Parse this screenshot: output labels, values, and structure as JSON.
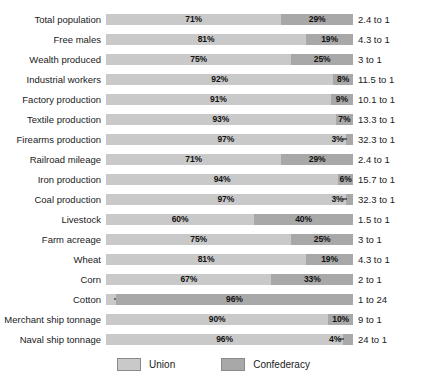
{
  "chart_data": {
    "type": "bar",
    "subtype": "stacked-horizontal-100pct",
    "title": "",
    "xlabel": "",
    "ylabel": "",
    "xlim": [
      0,
      100
    ],
    "grid": false,
    "legend_position": "bottom-center",
    "legend": [
      "Union",
      "Confederacy"
    ],
    "colors": {
      "union": "#c9c9c9",
      "confederacy": "#a8a8a8",
      "background": "#ffffff",
      "text": "#1a1a1a"
    },
    "categories": [
      "Total population",
      "Free males",
      "Wealth produced",
      "Industrial workers",
      "Factory production",
      "Textile production",
      "Firearms production",
      "Railroad mileage",
      "Iron production",
      "Coal production",
      "Livestock",
      "Farm acreage",
      "Wheat",
      "Corn",
      "Cotton",
      "Merchant ship tonnage",
      "Naval ship tonnage"
    ],
    "series": [
      {
        "name": "Union",
        "values": [
          71,
          81,
          75,
          92,
          91,
          93,
          97,
          71,
          94,
          97,
          60,
          75,
          81,
          67,
          4,
          90,
          96
        ]
      },
      {
        "name": "Confederacy",
        "values": [
          29,
          19,
          25,
          8,
          9,
          7,
          3,
          29,
          6,
          3,
          40,
          25,
          19,
          33,
          96,
          10,
          4
        ]
      }
    ],
    "ratios": [
      "2.4 to 1",
      "4.3 to 1",
      "3 to 1",
      "11.5 to 1",
      "10.1 to 1",
      "13.3 to 1",
      "32.3 to 1",
      "2.4 to 1",
      "15.7 to 1",
      "32.3 to 1",
      "1.5 to 1",
      "3 to 1",
      "4.3 to 1",
      "2 to 1",
      "1 to 24",
      "9 to 1",
      "24 to 1"
    ],
    "rows": [
      {
        "label": "Total population",
        "union": 71,
        "confederacy": 29,
        "union_label": "71%",
        "confederacy_label": "29%",
        "ratio": "2.4 to 1",
        "tiny": "none"
      },
      {
        "label": "Free males",
        "union": 81,
        "confederacy": 19,
        "union_label": "81%",
        "confederacy_label": "19%",
        "ratio": "4.3 to 1",
        "tiny": "none"
      },
      {
        "label": "Wealth produced",
        "union": 75,
        "confederacy": 25,
        "union_label": "75%",
        "confederacy_label": "25%",
        "ratio": "3 to 1",
        "tiny": "none"
      },
      {
        "label": "Industrial workers",
        "union": 92,
        "confederacy": 8,
        "union_label": "92%",
        "confederacy_label": "8%",
        "ratio": "11.5 to 1",
        "tiny": "none"
      },
      {
        "label": "Factory production",
        "union": 91,
        "confederacy": 9,
        "union_label": "91%",
        "confederacy_label": "9%",
        "ratio": "10.1 to 1",
        "tiny": "none"
      },
      {
        "label": "Textile production",
        "union": 93,
        "confederacy": 7,
        "union_label": "93%",
        "confederacy_label": "7%",
        "ratio": "13.3 to 1",
        "tiny": "none"
      },
      {
        "label": "Firearms production",
        "union": 97,
        "confederacy": 3,
        "union_label": "97%",
        "confederacy_label": "3%",
        "ratio": "32.3 to 1",
        "tiny": "right"
      },
      {
        "label": "Railroad mileage",
        "union": 71,
        "confederacy": 29,
        "union_label": "71%",
        "confederacy_label": "29%",
        "ratio": "2.4 to 1",
        "tiny": "none"
      },
      {
        "label": "Iron production",
        "union": 94,
        "confederacy": 6,
        "union_label": "94%",
        "confederacy_label": "6%",
        "ratio": "15.7 to 1",
        "tiny": "none"
      },
      {
        "label": "Coal production",
        "union": 97,
        "confederacy": 3,
        "union_label": "97%",
        "confederacy_label": "3%",
        "ratio": "32.3 to 1",
        "tiny": "right"
      },
      {
        "label": "Livestock",
        "union": 60,
        "confederacy": 40,
        "union_label": "60%",
        "confederacy_label": "40%",
        "ratio": "1.5 to 1",
        "tiny": "none"
      },
      {
        "label": "Farm acreage",
        "union": 75,
        "confederacy": 25,
        "union_label": "75%",
        "confederacy_label": "25%",
        "ratio": "3 to 1",
        "tiny": "none"
      },
      {
        "label": "Wheat",
        "union": 81,
        "confederacy": 19,
        "union_label": "81%",
        "confederacy_label": "19%",
        "ratio": "4.3 to 1",
        "tiny": "none"
      },
      {
        "label": "Corn",
        "union": 67,
        "confederacy": 33,
        "union_label": "67%",
        "confederacy_label": "33%",
        "ratio": "2 to 1",
        "tiny": "none"
      },
      {
        "label": "Cotton",
        "union": 4,
        "confederacy": 96,
        "union_label": "4%",
        "confederacy_label": "96%",
        "ratio": "1 to 24",
        "tiny": "left"
      },
      {
        "label": "Merchant ship tonnage",
        "union": 90,
        "confederacy": 10,
        "union_label": "90%",
        "confederacy_label": "10%",
        "ratio": "9 to 1",
        "tiny": "none"
      },
      {
        "label": "Naval ship tonnage",
        "union": 96,
        "confederacy": 4,
        "union_label": "96%",
        "confederacy_label": "4%",
        "ratio": "24 to 1",
        "tiny": "right"
      }
    ]
  },
  "legend": {
    "items": [
      {
        "label": "Union",
        "color": "#c9c9c9"
      },
      {
        "label": "Confederacy",
        "color": "#a8a8a8"
      }
    ]
  }
}
